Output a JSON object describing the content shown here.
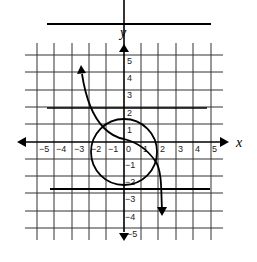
{
  "graph": {
    "axes": {
      "x_label": "x",
      "y_label": "y",
      "x_range": [
        -5,
        5
      ],
      "y_range": [
        -5,
        5
      ],
      "x_ticks": [
        "−5",
        "−4",
        "−3",
        "−2",
        "−1",
        "0",
        "1",
        "2",
        "3",
        "4",
        "5"
      ],
      "y_ticks_positive": [
        "1",
        "2",
        "3",
        "4",
        "5"
      ],
      "y_ticks_negative": [
        "−1",
        "−2",
        "−3",
        "−4",
        "−5"
      ]
    },
    "horizontal_lines": [
      {
        "y": 6.8,
        "label": "top line"
      },
      {
        "y": 2,
        "label": "middle line"
      },
      {
        "y": -2.75,
        "label": "bottom line"
      }
    ],
    "circle": {
      "center": [
        0,
        -0.6
      ],
      "radius": 2.1
    },
    "curve": {
      "type": "cubic-like",
      "start_arrow": [
        -3,
        4.2
      ],
      "points": [
        [
          -3,
          4.2
        ],
        [
          -2,
          1.6
        ],
        [
          -1.2,
          0.5
        ],
        [
          0,
          0.1
        ],
        [
          1,
          -0.6
        ],
        [
          1.8,
          -2.2
        ],
        [
          2,
          -4
        ]
      ],
      "end_arrow": [
        2,
        -4
      ]
    },
    "colors": {
      "line": "#000000",
      "grid": "#222222",
      "background": "#ffffff"
    }
  }
}
